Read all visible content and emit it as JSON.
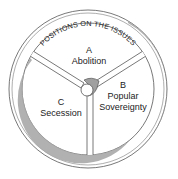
{
  "diagram": {
    "ring_title": "POSITIONS ON THE ISSUES",
    "sections": [
      {
        "letter": "A",
        "label": "Abolition"
      },
      {
        "letter": "B",
        "label_line1": "Popular",
        "label_line2": "Sovereignty"
      },
      {
        "letter": "C",
        "label": "Secession"
      }
    ],
    "colors": {
      "line": "#555555",
      "shade": "#a9a9a9",
      "text": "#222222",
      "background": "#ffffff"
    }
  }
}
